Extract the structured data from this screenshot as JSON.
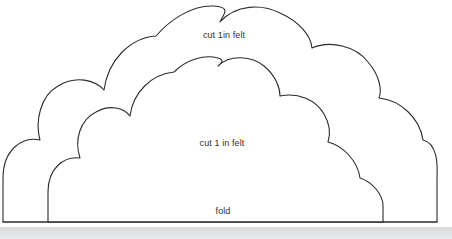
{
  "page": {
    "width": 452,
    "height": 239,
    "background_color": "#ffffff",
    "ink_color": "#2b2b2b",
    "text_color": "#303030",
    "strip_color": "#dfe1e2"
  },
  "labels": {
    "outer_cloud": "cut 1in felt",
    "inner_cloud": "cut 1 in felt",
    "fold": "fold"
  },
  "shapes": {
    "outer_cloud": {
      "name": "outer-cloud-outline",
      "bump_count": 7,
      "left_extent_px": 3,
      "right_extent_px": 437,
      "top_extent_px": 5,
      "baseline_px": 222
    },
    "inner_cloud": {
      "name": "inner-cloud-outline",
      "bump_count": 7,
      "left_extent_px": 48,
      "right_extent_px": 383,
      "top_extent_px": 57,
      "baseline_px": 222
    },
    "fold_line": {
      "name": "fold-baseline",
      "y_px": 222,
      "x_start_px": 3,
      "x_end_px": 437
    }
  }
}
